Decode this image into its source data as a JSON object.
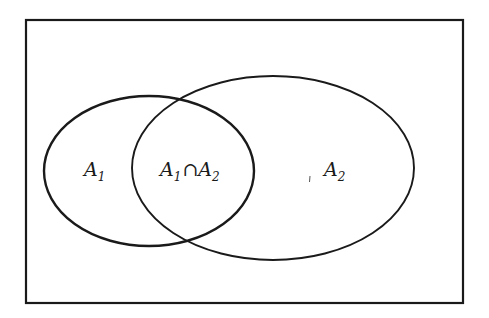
{
  "diagram": {
    "type": "venn",
    "universe": {
      "label": ""
    },
    "sets": [
      {
        "id": "A1",
        "base": "A",
        "subscript": "1"
      },
      {
        "id": "A2",
        "base": "A",
        "subscript": "2"
      }
    ],
    "regions": {
      "a1_only": {
        "base": "A",
        "subscript": "1"
      },
      "intersection": {
        "left_base": "A",
        "left_sub": "1",
        "operator": "∩",
        "right_base": "A",
        "right_sub": "2"
      },
      "a2_only": {
        "base": "A",
        "subscript": "2"
      }
    },
    "colors": {
      "stroke": "#1a1a1a",
      "background": "#ffffff"
    }
  }
}
